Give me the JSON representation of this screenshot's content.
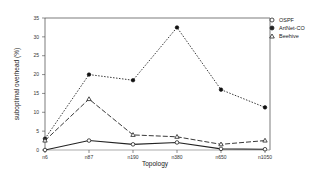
{
  "chart_data": {
    "type": "line",
    "title": "",
    "xlabel": "Topology",
    "ylabel": "suboptimal overhead (%)",
    "categories": [
      "n6",
      "n87",
      "n190",
      "n380",
      "n650",
      "n1050"
    ],
    "ylim": [
      0,
      35
    ],
    "yticks": [
      0,
      5,
      10,
      15,
      20,
      25,
      30,
      35
    ],
    "grid": false,
    "legend_position": "right",
    "series": [
      {
        "name": "OSPF",
        "marker": "circle-open",
        "line": "solid",
        "values": [
          0,
          2.5,
          1.5,
          2,
          0.3,
          0.2
        ]
      },
      {
        "name": "ArtNet-CO",
        "marker": "circle-filled",
        "line": "dotted",
        "values": [
          3,
          20,
          18.5,
          32.5,
          16,
          11.3
        ]
      },
      {
        "name": "Beehive",
        "marker": "triangle-open",
        "line": "dashed",
        "values": [
          2.5,
          13.5,
          4,
          3.5,
          1.5,
          2.5
        ]
      }
    ]
  },
  "legend": {
    "items": [
      {
        "label": "OSPF",
        "icon": "open-circle-icon"
      },
      {
        "label": "ArtNet-CO",
        "icon": "filled-circle-icon"
      },
      {
        "label": "Beehive",
        "icon": "open-triangle-icon"
      }
    ]
  }
}
